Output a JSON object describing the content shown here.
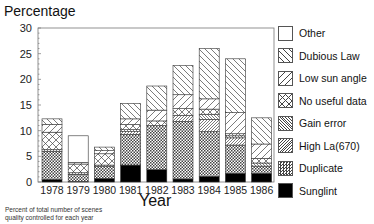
{
  "chart_data": {
    "type": "bar",
    "stacked": true,
    "title": "",
    "ylabel": "Percentage",
    "xlabel": "Year",
    "ylim": [
      0,
      30
    ],
    "yticks": [
      0,
      5,
      10,
      15,
      20,
      25,
      30
    ],
    "grid": false,
    "legend_position": "right",
    "categories": [
      "1978",
      "1979",
      "1980",
      "1981",
      "1982",
      "1983",
      "1984",
      "1985",
      "1986"
    ],
    "series": [
      {
        "name": "Sunglint",
        "pattern": "solid-black",
        "values": [
          0.5,
          0.1,
          0.7,
          3.3,
          2.4,
          0.6,
          1.1,
          1.7,
          1.7
        ]
      },
      {
        "name": "Duplicate",
        "pattern": "checker",
        "values": [
          5.5,
          1.4,
          2.3,
          6.0,
          8.6,
          11.2,
          8.7,
          5.5,
          1.4
        ]
      },
      {
        "name": "High La(670)",
        "pattern": "fine-diag",
        "values": [
          0.3,
          0.3,
          0.3,
          0.5,
          0.0,
          1.2,
          2.4,
          1.4,
          0.0
        ]
      },
      {
        "name": "Gain error",
        "pattern": "fine-back",
        "values": [
          0.0,
          0.0,
          0.0,
          0.4,
          0.0,
          0.0,
          1.0,
          0.4,
          0.6
        ]
      },
      {
        "name": "No useful data",
        "pattern": "cross",
        "values": [
          3.4,
          1.7,
          2.2,
          1.0,
          0.9,
          1.3,
          1.0,
          0.4,
          0.9
        ]
      },
      {
        "name": "Low sun angle",
        "pattern": "diag",
        "values": [
          1.5,
          0.3,
          0.6,
          1.1,
          2.1,
          2.7,
          2.0,
          4.1,
          2.8
        ]
      },
      {
        "name": "Dubious Law",
        "pattern": "back-diag",
        "values": [
          1.1,
          0.0,
          0.7,
          3.0,
          4.7,
          5.7,
          9.8,
          10.5,
          5.1
        ]
      },
      {
        "name": "Other",
        "pattern": "empty",
        "values": [
          0.0,
          5.2,
          0.0,
          0.0,
          0.0,
          0.0,
          0.0,
          0.0,
          0.0
        ]
      }
    ],
    "totals": [
      12.3,
      9.0,
      6.8,
      15.3,
      18.7,
      22.7,
      26.0,
      24.0,
      12.5
    ],
    "annotations": [
      "Percent of total number of scenes",
      "quality controlled for each year"
    ]
  },
  "legend": {
    "items": [
      {
        "label": "Other",
        "pattern": "empty"
      },
      {
        "label": "Dubious Law",
        "pattern": "back-diag"
      },
      {
        "label": "Low sun angle",
        "pattern": "diag"
      },
      {
        "label": "No useful data",
        "pattern": "cross"
      },
      {
        "label": "Gain error",
        "pattern": "fine-back"
      },
      {
        "label": "High La(670)",
        "pattern": "fine-diag"
      },
      {
        "label": "Duplicate",
        "pattern": "checker"
      },
      {
        "label": "Sunglint",
        "pattern": "solid-black"
      }
    ]
  },
  "labels": {
    "y_axis": "Percentage",
    "x_axis": "Year",
    "caption_line1": "Percent of total number of scenes",
    "caption_line2": "quality controlled for each year"
  }
}
